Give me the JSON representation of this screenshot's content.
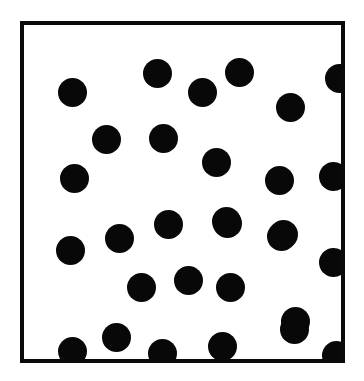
{
  "figure": {
    "title": "",
    "background_color": "#ffffff",
    "canvas": {
      "width": 364,
      "height": 381
    }
  },
  "frame": {
    "name": "square-border",
    "x": 20,
    "y": 21,
    "width": 325,
    "height": 342,
    "border_width": 4,
    "border_color": "#0a0a0a",
    "fill_color": "#ffffff"
  },
  "marker_style": {
    "shape": "circle",
    "fill_color": "#080808",
    "diameter": 29,
    "count_label": "30"
  },
  "chart_data": {
    "type": "scatter",
    "title": "",
    "xlabel": "",
    "ylabel": "",
    "grid": false,
    "legend": null,
    "xlim": [
      0,
      325
    ],
    "ylim": [
      0,
      342
    ],
    "point_count": 30,
    "marker_diameter": 29,
    "marker_color": "#080808",
    "points": [
      {
        "x": 52,
        "y": 71
      },
      {
        "x": 137,
        "y": 52
      },
      {
        "x": 182,
        "y": 71
      },
      {
        "x": 219,
        "y": 51
      },
      {
        "x": 270,
        "y": 86
      },
      {
        "x": 319,
        "y": 57
      },
      {
        "x": 86,
        "y": 118
      },
      {
        "x": 143,
        "y": 117
      },
      {
        "x": 54,
        "y": 157
      },
      {
        "x": 196,
        "y": 141
      },
      {
        "x": 259,
        "y": 159
      },
      {
        "x": 313,
        "y": 155
      },
      {
        "x": 50,
        "y": 229
      },
      {
        "x": 99,
        "y": 217
      },
      {
        "x": 148,
        "y": 203
      },
      {
        "x": 206,
        "y": 200
      },
      {
        "x": 261,
        "y": 215
      },
      {
        "x": 313,
        "y": 241
      },
      {
        "x": 121,
        "y": 266
      },
      {
        "x": 168,
        "y": 259
      },
      {
        "x": 210,
        "y": 266
      },
      {
        "x": 275,
        "y": 300
      },
      {
        "x": 52,
        "y": 330
      },
      {
        "x": 96,
        "y": 316
      },
      {
        "x": 142,
        "y": 332
      },
      {
        "x": 202,
        "y": 325
      },
      {
        "x": 274,
        "y": 308
      },
      {
        "x": 316,
        "y": 334
      },
      {
        "x": 207,
        "y": 202
      },
      {
        "x": 263,
        "y": 213
      }
    ]
  }
}
